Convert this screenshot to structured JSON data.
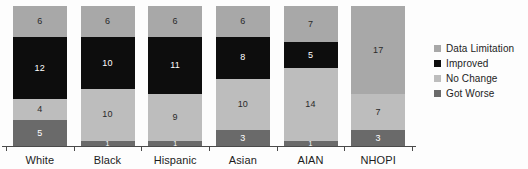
{
  "chart_data": {
    "type": "bar",
    "stacked": true,
    "title": "",
    "subtitle": "",
    "xlabel": "",
    "ylabel": "",
    "grid": false,
    "ylim": [
      0,
      27
    ],
    "legend_position": "right",
    "categories": [
      "White",
      "Black",
      "Hispanic",
      "Asian",
      "AIAN",
      "NHOPI"
    ],
    "series": [
      {
        "name": "Data Limitation",
        "color": "#a8a8a8",
        "label_color": "#2a2a2a",
        "values": [
          6,
          6,
          6,
          6,
          7,
          17
        ]
      },
      {
        "name": "Improved",
        "color": "#0d0d0d",
        "label_color": "#ffffff",
        "values": [
          12,
          10,
          11,
          8,
          5,
          0
        ]
      },
      {
        "name": "No Change",
        "color": "#bdbdbd",
        "label_color": "#2a2a2a",
        "values": [
          4,
          10,
          9,
          10,
          14,
          7
        ]
      },
      {
        "name": "Got Worse",
        "color": "#6a6a6a",
        "label_color": "#ffffff",
        "values": [
          5,
          1,
          1,
          3,
          1,
          3
        ]
      }
    ],
    "category_totals": [
      27,
      27,
      27,
      27,
      27,
      27
    ]
  },
  "legend": {
    "items": [
      {
        "label": "Data Limitation",
        "color": "#a8a8a8"
      },
      {
        "label": "Improved",
        "color": "#0d0d0d"
      },
      {
        "label": "No Change",
        "color": "#bdbdbd"
      },
      {
        "label": "Got Worse",
        "color": "#6a6a6a"
      }
    ]
  },
  "axis": {
    "category_labels": [
      "White",
      "Black",
      "Hispanic",
      "Asian",
      "AIAN",
      "NHOPI"
    ]
  }
}
